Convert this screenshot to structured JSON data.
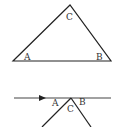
{
  "figure_top": {
    "description": "triangle",
    "vertices": {
      "A": [
        13,
        61
      ],
      "B": [
        111,
        61
      ],
      "C": [
        70,
        5
      ]
    },
    "labels": [
      {
        "text": "C",
        "x": 70,
        "y": 20
      },
      {
        "text": "A",
        "x": 28,
        "y": 60
      },
      {
        "text": "B",
        "x": 99,
        "y": 60
      }
    ]
  },
  "figure_bottom": {
    "description": "line with arrow and inverted V meeting at point",
    "labels": [
      {
        "text": "A",
        "x": 55,
        "y": 106
      },
      {
        "text": "C",
        "x": 71,
        "y": 111
      },
      {
        "text": "B",
        "x": 83,
        "y": 105
      }
    ]
  },
  "colors": {
    "stroke": "#222222"
  }
}
